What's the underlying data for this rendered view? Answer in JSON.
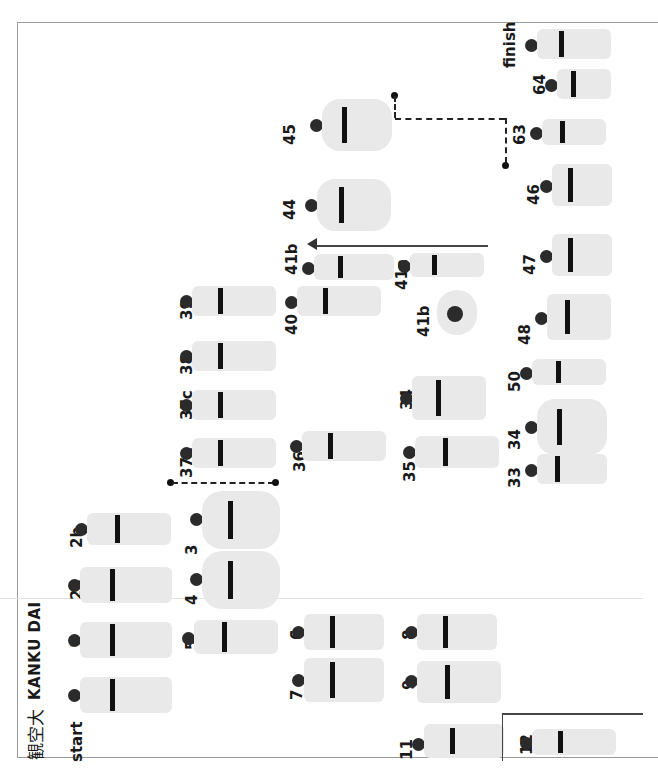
{
  "page": {
    "title_kanji": "観空大",
    "title": "KANKU DAI",
    "orientation": "rotated 90° counter-clockwise"
  },
  "steps": [
    {
      "id": "start",
      "label": "start"
    },
    {
      "id": "1",
      "label": "1"
    },
    {
      "id": "2a",
      "label": "2a"
    },
    {
      "id": "2b",
      "label": "2b"
    },
    {
      "id": "3",
      "label": "3"
    },
    {
      "id": "4",
      "label": "4"
    },
    {
      "id": "5",
      "label": "5"
    },
    {
      "id": "6",
      "label": "6"
    },
    {
      "id": "7",
      "label": "7"
    },
    {
      "id": "8",
      "label": "8"
    },
    {
      "id": "9",
      "label": "9"
    },
    {
      "id": "11",
      "label": "11"
    },
    {
      "id": "12",
      "label": "12"
    },
    {
      "id": "33",
      "label": "33"
    },
    {
      "id": "34",
      "label": "34"
    },
    {
      "id": "35",
      "label": "35"
    },
    {
      "id": "36",
      "label": "36"
    },
    {
      "id": "37a",
      "label": "37a"
    },
    {
      "id": "37c",
      "label": "37c"
    },
    {
      "id": "38",
      "label": "38"
    },
    {
      "id": "39",
      "label": "39"
    },
    {
      "id": "40",
      "label": "40"
    },
    {
      "id": "41a",
      "label": "41a"
    },
    {
      "id": "41b",
      "label": "41b"
    },
    {
      "id": "42",
      "label": "42"
    },
    {
      "id": "43",
      "label": "43"
    },
    {
      "id": "44",
      "label": "44"
    },
    {
      "id": "45",
      "label": "45"
    },
    {
      "id": "46",
      "label": "46"
    },
    {
      "id": "47",
      "label": "47"
    },
    {
      "id": "48",
      "label": "48"
    },
    {
      "id": "50",
      "label": "50"
    },
    {
      "id": "63",
      "label": "63"
    },
    {
      "id": "64",
      "label": "64"
    },
    {
      "id": "finish",
      "label": "finish"
    }
  ]
}
